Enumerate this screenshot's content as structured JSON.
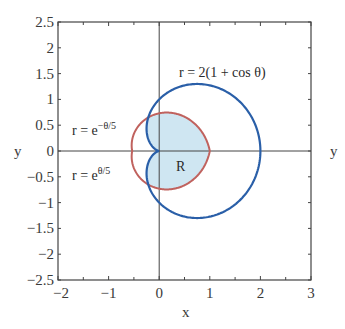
{
  "chart_data": {
    "type": "line",
    "title": "",
    "xlabel": "x",
    "ylabel": "y",
    "xlim": [
      -2,
      3
    ],
    "ylim": [
      -2.5,
      2.5
    ],
    "grid": false,
    "x_ticks": [
      "−2",
      "−1",
      "0",
      "1",
      "2",
      "3"
    ],
    "y_ticks": [
      "2.5",
      "2",
      "1.5",
      "1",
      "0.5",
      "0",
      "−0.5",
      "−1",
      "−1.5",
      "−2",
      "−2.5"
    ],
    "series": [
      {
        "name": "r = 2(1 + cos θ)",
        "color": "#2a5fa8",
        "kind": "polar",
        "description": "cardioid, rightmost point x=2, cusp at origin, max |y|≈1.3"
      },
      {
        "name": "r = e^(−θ/5)",
        "color": "#c0625e",
        "kind": "polar",
        "theta_range": "[0, π]",
        "description": "upper half, from (1,0) through (0,0.73) to (−0.53,0)"
      },
      {
        "name": "r = e^(θ/5)",
        "color": "#c0625e",
        "kind": "polar",
        "theta_range": "[−π, 0]",
        "description": "lower half, mirror image"
      }
    ],
    "annotations": [
      {
        "text": "r = 2(1 + cos θ)",
        "x": 1.0,
        "y": 1.4
      },
      {
        "text": "r = e^(−θ/5)",
        "x": -1.7,
        "y": 0.35
      },
      {
        "text": "r = e^(θ/5)",
        "x": -1.7,
        "y": -0.55
      },
      {
        "text": "R",
        "x": 0.45,
        "y": -0.25,
        "description": "shaded region inside both curves"
      }
    ],
    "region_fill": "#cfe6f2"
  },
  "labels": {
    "xlabel": "x",
    "ylabel_left": "y",
    "ylabel_right": "y",
    "cardioid": "r = 2(1 + cos θ)",
    "upper_exp_base": "r = e",
    "upper_exp_sup": "−θ/5",
    "lower_exp_base": "r = e",
    "lower_exp_sup": "θ/5",
    "region": "R"
  },
  "ticks": {
    "x": [
      "−2",
      "−1",
      "0",
      "1",
      "2",
      "3"
    ],
    "y": [
      "2.5",
      "2",
      "1.5",
      "1",
      "0.5",
      "0",
      "−0.5",
      "−1",
      "−1.5",
      "−2",
      "−2.5"
    ]
  }
}
